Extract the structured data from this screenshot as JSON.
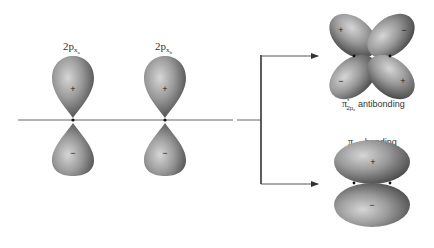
{
  "diagram": {
    "atomic_orbitals": [
      {
        "label_main": "2p",
        "label_sub": "x",
        "label_subsub": "a",
        "upper_sign": "+",
        "lower_sign": "−"
      },
      {
        "label_main": "2p",
        "label_sub": "x",
        "label_subsub": "b",
        "upper_sign": "+",
        "lower_sign": "−"
      }
    ],
    "molecular_orbitals": {
      "antibonding": {
        "label_symbol": "π",
        "label_star": "*",
        "label_sub": "2p",
        "label_subsub": "x",
        "label_text": "antibonding",
        "signs": {
          "top_left": "+",
          "top_right": "−",
          "bottom_left": "−",
          "bottom_right": "+"
        }
      },
      "bonding": {
        "label_symbol": "π",
        "label_sub": "2p",
        "label_subsub": "x",
        "label_text": "bonding",
        "signs": {
          "upper": "+",
          "lower": "−"
        }
      }
    },
    "colors": {
      "lobe_light": "#c8c8c8",
      "lobe_dark": "#4a4a4a",
      "line": "#555555",
      "text": "#333333"
    }
  }
}
